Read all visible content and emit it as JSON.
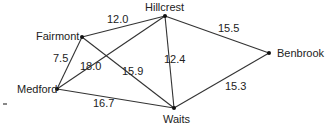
{
  "diagram": {
    "type": "weighted-graph",
    "nodes": [
      {
        "id": "fairmont",
        "label": "Fairmont"
      },
      {
        "id": "hillcrest",
        "label": "Hillcrest"
      },
      {
        "id": "benbrook",
        "label": "Benbrook"
      },
      {
        "id": "medford",
        "label": "Medford"
      },
      {
        "id": "waits",
        "label": "Waits"
      }
    ],
    "edges": [
      {
        "from": "fairmont",
        "to": "hillcrest",
        "weight": "12.0"
      },
      {
        "from": "hillcrest",
        "to": "benbrook",
        "weight": "15.5"
      },
      {
        "from": "fairmont",
        "to": "medford",
        "weight": "7.5"
      },
      {
        "from": "medford",
        "to": "hillcrest",
        "weight": "18.0"
      },
      {
        "from": "fairmont",
        "to": "waits",
        "weight": "15.9"
      },
      {
        "from": "hillcrest",
        "to": "waits",
        "weight": "12.4"
      },
      {
        "from": "medford",
        "to": "waits",
        "weight": "16.7"
      },
      {
        "from": "waits",
        "to": "benbrook",
        "weight": "15.3"
      }
    ]
  }
}
